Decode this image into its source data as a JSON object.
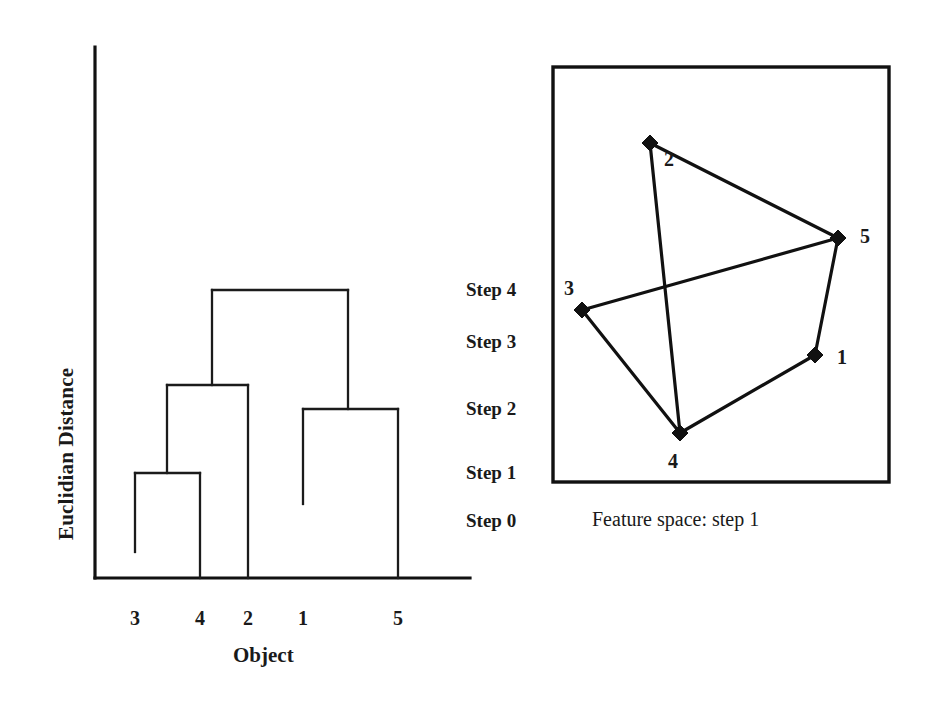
{
  "figure": {
    "background": "#ffffff",
    "ink_color": "#111111",
    "width": 930,
    "height": 723
  },
  "dendrogram": {
    "y_axis_label": "Euclidian Distance",
    "x_axis_label": "Object",
    "leaf_labels": [
      "3",
      "4",
      "2",
      "1",
      "5"
    ],
    "leaf_x": [
      135,
      200,
      248,
      303,
      398
    ],
    "axis": {
      "origin_x": 95,
      "baseline_y": 578,
      "top_y": 47,
      "right_x": 470
    },
    "merges": [
      {
        "name": "merge-3-4",
        "left_x": 135,
        "right_x": 200,
        "height_y": 473,
        "left_stub_y": 552,
        "right_stub_y": 578
      },
      {
        "name": "merge-34-2",
        "left_x": 167,
        "right_x": 248,
        "height_y": 385,
        "left_stub_y": 473,
        "right_stub_y": 578
      },
      {
        "name": "merge-1-5",
        "left_x": 303,
        "right_x": 398,
        "height_y": 409,
        "left_stub_y": 504,
        "right_stub_y": 578
      },
      {
        "name": "merge-root",
        "left_x": 212,
        "right_x": 348,
        "height_y": 290,
        "left_stub_y": 385,
        "right_stub_y": 409
      }
    ]
  },
  "step_scale": {
    "labels": [
      "Step 4",
      "Step 3",
      "Step 2",
      "Step 1",
      "Step 0"
    ],
    "y_positions": [
      290,
      342,
      409,
      473,
      521
    ]
  },
  "feature_space": {
    "caption": "Feature space: step 1",
    "box": {
      "x": 553,
      "y": 67,
      "width": 336,
      "height": 415
    },
    "points": [
      {
        "id": "2",
        "x": 650,
        "y": 143,
        "label_dx": 14,
        "label_dy": 16
      },
      {
        "id": "5",
        "x": 838,
        "y": 238,
        "label_dx": 22,
        "label_dy": -2
      },
      {
        "id": "3",
        "x": 582,
        "y": 310,
        "label_dx": -18,
        "label_dy": -22
      },
      {
        "id": "1",
        "x": 815,
        "y": 355,
        "label_dx": 22,
        "label_dy": 2
      },
      {
        "id": "4",
        "x": 680,
        "y": 433,
        "label_dx": -12,
        "label_dy": 28
      }
    ],
    "edges": [
      {
        "name": "edge-2-5",
        "from": "2",
        "to": "5"
      },
      {
        "name": "edge-2-4",
        "from": "2",
        "to": "4"
      },
      {
        "name": "edge-5-3",
        "from": "5",
        "to": "3"
      },
      {
        "name": "edge-5-1",
        "from": "5",
        "to": "1"
      },
      {
        "name": "edge-3-4",
        "from": "3",
        "to": "4"
      },
      {
        "name": "edge-4-1",
        "from": "4",
        "to": "1"
      }
    ]
  },
  "chart_data": {
    "type": "line",
    "xlabel": "Object",
    "ylabel": "Euclidian Distance",
    "categories": [
      "3",
      "4",
      "2",
      "1",
      "5"
    ],
    "grid": false,
    "legend": "none",
    "step_ticks": [
      "Step 0",
      "Step 1",
      "Step 2",
      "Step 3",
      "Step 4"
    ],
    "linkage_steps": [
      {
        "step": "Step 1",
        "merged": [
          "3",
          "4"
        ],
        "height_step": 1
      },
      {
        "step": "Step 2",
        "merged": [
          "1",
          "5"
        ],
        "height_step": 2
      },
      {
        "step": "Step 3",
        "merged": [
          "3",
          "4",
          "2"
        ],
        "height_step": 3
      },
      {
        "step": "Step 4",
        "merged": [
          "3",
          "4",
          "2",
          "1",
          "5"
        ],
        "height_step": 4
      }
    ],
    "scatter_points": [
      {
        "id": "1",
        "x": 815,
        "y": 355
      },
      {
        "id": "2",
        "x": 650,
        "y": 143
      },
      {
        "id": "3",
        "x": 582,
        "y": 310
      },
      {
        "id": "4",
        "x": 680,
        "y": 433
      },
      {
        "id": "5",
        "x": 838,
        "y": 238
      }
    ],
    "scatter_edges": [
      [
        "2",
        "5"
      ],
      [
        "2",
        "4"
      ],
      [
        "5",
        "3"
      ],
      [
        "5",
        "1"
      ],
      [
        "3",
        "4"
      ],
      [
        "4",
        "1"
      ]
    ],
    "annotation": "Feature space: step 1"
  }
}
